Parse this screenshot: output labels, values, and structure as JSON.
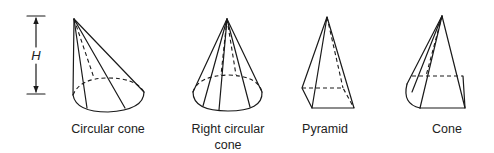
{
  "diagram": {
    "height_label": "H",
    "shapes": [
      {
        "id": "circular-cone",
        "label": "Circular cone"
      },
      {
        "id": "right-circular-cone",
        "label_line1": "Right circular",
        "label_line2": "cone"
      },
      {
        "id": "pyramid",
        "label": "Pyramid"
      },
      {
        "id": "cone",
        "label": "Cone"
      }
    ]
  }
}
